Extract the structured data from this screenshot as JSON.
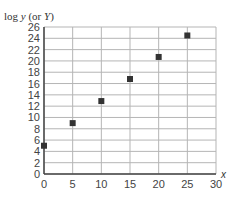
{
  "chart_data": {
    "type": "scatter",
    "title": "",
    "xlabel": "x",
    "ylabel": "log y (or Y)",
    "x": [
      0,
      5,
      10,
      15,
      20,
      25
    ],
    "series": [
      {
        "name": "log y",
        "values": [
          5.0,
          9.0,
          12.9,
          16.8,
          20.7,
          24.5
        ]
      }
    ],
    "xlim": [
      0,
      30
    ],
    "ylim": [
      0,
      26
    ],
    "xticks": [
      0,
      5,
      10,
      15,
      20,
      25,
      30
    ],
    "yticks": [
      0,
      2,
      4,
      6,
      8,
      10,
      12,
      14,
      16,
      18,
      20,
      22,
      24,
      26
    ],
    "grid": true,
    "marker": "square",
    "marker_color": "#333333",
    "grid_color": "#b5b5b5",
    "axis_color": "#444444"
  },
  "labels": {
    "y_axis_prefix": "log ",
    "y_axis_var": "y",
    "y_axis_mid": " (or ",
    "y_axis_var2": "Y",
    "y_axis_suffix": ")",
    "x_axis_var": "x"
  }
}
